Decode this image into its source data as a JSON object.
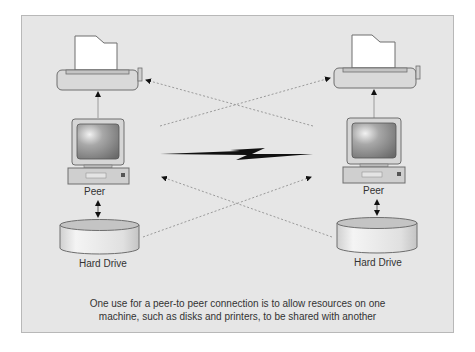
{
  "diagram": {
    "nodes": {
      "left": {
        "printer": {
          "icon": "printer-icon"
        },
        "computer": {
          "icon": "desktop-computer-icon",
          "label": "Peer"
        },
        "disk": {
          "icon": "hard-drive-icon",
          "label": "Hard Drive"
        }
      },
      "right": {
        "printer": {
          "icon": "printer-icon"
        },
        "computer": {
          "icon": "desktop-computer-icon",
          "label": "Peer"
        },
        "disk": {
          "icon": "hard-drive-icon",
          "label": "Hard Drive"
        }
      }
    },
    "link": {
      "icon": "lightning-bolt-icon",
      "type": "network connection"
    },
    "caption": {
      "line1": "One use for a peer-to peer connection is to allow resources on one",
      "line2": "machine, such as disks and printers, to be shared with another"
    },
    "colors": {
      "background": "#e6e6e6",
      "frame_border": "#b8b8b8",
      "device_fill": "#d9d9d9",
      "device_stroke": "#6e6e6e",
      "dashed_line": "#9a9a9a",
      "bolt": "#111111"
    }
  }
}
